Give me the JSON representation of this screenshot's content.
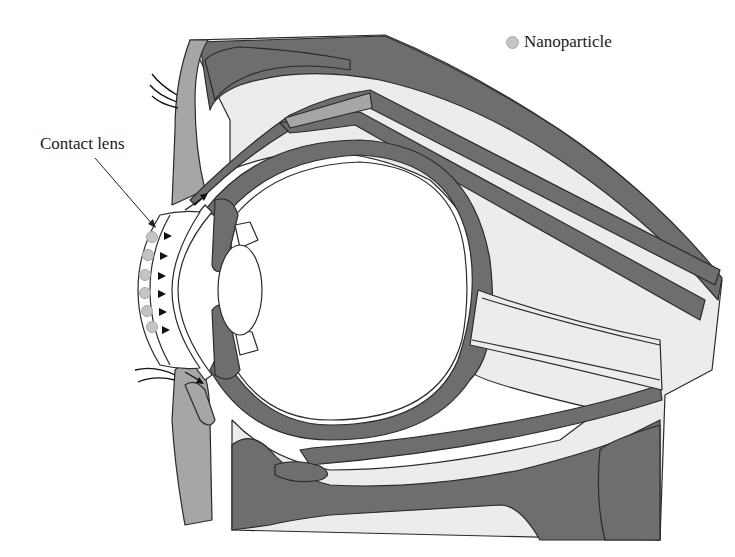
{
  "figure": {
    "legend": {
      "items": [
        {
          "symbol": "light-gray-circle",
          "label": "Nanoparticle",
          "color": "#c4c4c4"
        }
      ]
    },
    "annotations": [
      {
        "id": "contact-lens",
        "text": "Contact lens",
        "pointer": "arrow-to-lens"
      }
    ],
    "colors": {
      "dark_tissue": "#6e6e6e",
      "mid_tissue": "#a6a6a6",
      "light_tissue": "#ececec",
      "outline": "#2a2a2a",
      "nanoparticle": "#c4c4c4",
      "background": "#ffffff"
    },
    "nanoparticle_count": 6,
    "release_arrow_count": 6
  }
}
